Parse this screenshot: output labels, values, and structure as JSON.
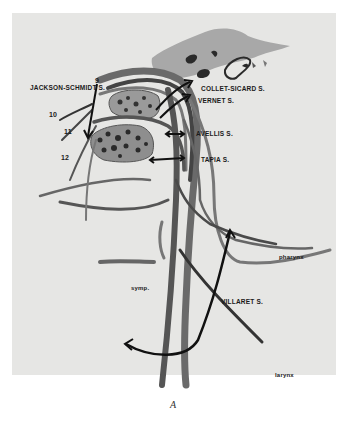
{
  "figure": {
    "caption": "A",
    "labels": {
      "jackson_schmidt": "JACKSON-SCHMIDT S.",
      "collet_sicard": "COLLET-SICARD S.",
      "vernet": "VERNET S.",
      "avellis": "AVELLIS S.",
      "tapia": "TAPIA S.",
      "villaret": "VILLARET S.",
      "symp": "symp.",
      "pharynx": "pharynx",
      "larynx": "larynx"
    },
    "nerve_numbers": {
      "n9": "9",
      "n10": "10",
      "n11": "11",
      "n12": "12"
    },
    "colors": {
      "background_panel": "#e6e6e4",
      "nerve_dark": "#3a3a3a",
      "nerve_mid": "#6b6b6b",
      "arrow": "#111111"
    }
  }
}
